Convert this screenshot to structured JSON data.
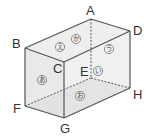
{
  "diagram": {
    "type": "rectangular-prism",
    "vertices": {
      "A": {
        "label": "A",
        "x": 91,
        "y": 19
      },
      "B": {
        "label": "B",
        "x": 25,
        "y": 48
      },
      "C": {
        "label": "C",
        "x": 64,
        "y": 62
      },
      "D": {
        "label": "D",
        "x": 130,
        "y": 31
      },
      "E": {
        "label": "E",
        "x": 91,
        "y": 78
      },
      "F": {
        "label": "F",
        "x": 25,
        "y": 106
      },
      "G": {
        "label": "G",
        "x": 64,
        "y": 118
      },
      "H": {
        "label": "H",
        "x": 130,
        "y": 88
      }
    },
    "vertex_labels": {
      "A": "A",
      "B": "B",
      "C": "C",
      "D": "D",
      "E": "E",
      "F": "F",
      "G": "G",
      "H": "H"
    },
    "face_labels": {
      "front_left": "あ",
      "back": "い",
      "right": "う",
      "top_front": "え",
      "bottom": "お",
      "top_back": "か"
    },
    "hidden_edges": [
      "A-E",
      "E-F",
      "E-H"
    ],
    "colors": {
      "edge": "#555555",
      "face_fill": "#e6e6e6",
      "bottom_fill": "#d8d8d8"
    }
  }
}
